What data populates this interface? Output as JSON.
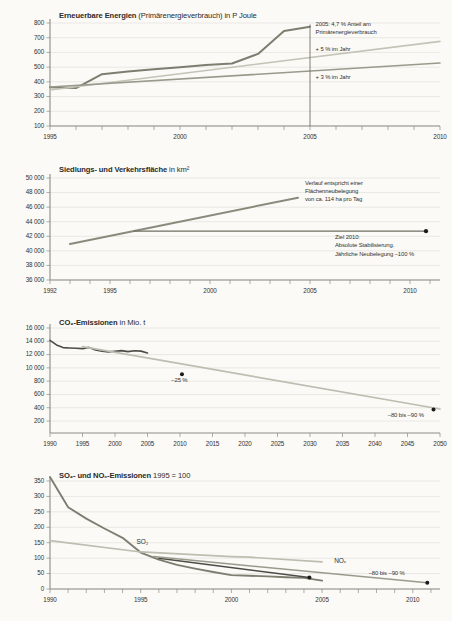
{
  "document": {
    "title": "Umweltindikatoren – Ziel- und Trendverläufe",
    "background_color": "#fbfaf7"
  },
  "palette": {
    "dark_line": "#6f6f63",
    "mid_line": "#9a9a8c",
    "light_line": "#bdbdb0",
    "very_light_line": "#cfcfc4",
    "dark_gray": "#4d4d46",
    "grid": "#d9d7d0",
    "axis": "#8d8b84",
    "text": "#33312e",
    "marker": "#1b1b1b"
  },
  "chart_data": [
    {
      "id": "renewable-energy",
      "type": "line",
      "title_bold": "Erneuerbare Energien",
      "title_rest": "(Primärenergieverbrauch) in P Joule",
      "xlabel": "",
      "ylabel": "",
      "xlim": [
        1995,
        2010
      ],
      "ylim": [
        100,
        800
      ],
      "ytick_labels": [
        "800",
        "700",
        "600",
        "500",
        "400",
        "300",
        "200",
        "100"
      ],
      "ytick_values": [
        800,
        700,
        600,
        500,
        400,
        300,
        200,
        100
      ],
      "xtick_values": [
        1995,
        1996,
        1997,
        1998,
        1999,
        2000,
        2001,
        2002,
        2003,
        2004,
        2005,
        2006,
        2007,
        2008,
        2009,
        2010
      ],
      "xtick_labels": [
        "1995",
        "2000",
        "2005",
        "2010"
      ],
      "xtick_label_values": [
        1995,
        2000,
        2005,
        2010
      ],
      "grid": true,
      "series": [
        {
          "name": "Ist-Verlauf erneuerbare Energien",
          "color": "#7d7d70",
          "width": 2.0,
          "x": [
            1995,
            1996,
            1997,
            1998,
            1999,
            2000,
            2001,
            2002,
            2003,
            2004,
            2005
          ],
          "values": [
            363,
            358,
            452,
            470,
            485,
            500,
            515,
            525,
            590,
            745,
            775
          ]
        },
        {
          "name": "+ 5 % im Jahr",
          "color": "#c3c3b6",
          "width": 1.6,
          "x": [
            1995,
            2010
          ],
          "values": [
            345,
            675
          ]
        },
        {
          "name": "+ 3 % im Jahr",
          "color": "#9a9a8c",
          "width": 1.6,
          "x": [
            1995,
            2010
          ],
          "values": [
            365,
            528
          ]
        }
      ],
      "vertical_marker": {
        "x": 2005,
        "y_from": 100,
        "y_to": 790
      },
      "annotations": [
        {
          "text_lines": [
            "2005: 4,7 % Anteil am",
            "Primärenergieverbrauch"
          ],
          "x": 2005.1,
          "y": 795
        },
        {
          "text_lines": [
            "+ 5 % im Jahr"
          ],
          "x": 2005.1,
          "y": 622
        },
        {
          "text_lines": [
            "+ 3 % im Jahr"
          ],
          "x": 2005.1,
          "y": 432
        }
      ]
    },
    {
      "id": "settlement-traffic-area",
      "type": "line",
      "title_bold": "Siedlungs- und Verkehrsfläche",
      "title_rest": "in km²",
      "xlim": [
        1992,
        2011.5
      ],
      "ylim": [
        36000,
        50000
      ],
      "ytick_labels": [
        "50 000",
        "48 000",
        "46 000",
        "44 000",
        "42 000",
        "40 000",
        "38 000",
        "36 000"
      ],
      "ytick_values": [
        50000,
        48000,
        46000,
        44000,
        42000,
        40000,
        38000,
        36000
      ],
      "xtick_values": [
        1992,
        1993,
        1994,
        1995,
        1996,
        1997,
        1998,
        1999,
        2000,
        2001,
        2002,
        2003,
        2004,
        2005,
        2006,
        2007,
        2008,
        2009,
        2010,
        2011
      ],
      "xtick_labels": [
        "1992",
        "1995",
        "2000",
        "2005",
        "2010"
      ],
      "xtick_label_values": [
        1992,
        1995,
        2000,
        2005,
        2010
      ],
      "grid": true,
      "series": [
        {
          "name": "Trend Flächenneubelegung",
          "color": "#8a8a7c",
          "width": 2.0,
          "x": [
            1993,
            2004.4
          ],
          "values": [
            40950,
            47300
          ]
        },
        {
          "name": "Ziel 2010 Stabilisierung",
          "color": "#6f6f63",
          "width": 1.2,
          "x": [
            1996.2,
            2010.8
          ],
          "values": [
            42700,
            42700
          ]
        }
      ],
      "markers": [
        {
          "x": 2010.8,
          "y": 42700,
          "color": "#1b1b1b",
          "r": 2.1
        }
      ],
      "annotations": [
        {
          "text_lines": [
            "Verlauf entspricht einer",
            "Flächenneubelegung",
            "von ca. 114 ha pro Tag"
          ],
          "x": 2004.6,
          "y": 49350
        },
        {
          "text_lines": [
            "Ziel 2010:",
            "Absolute Stabilisierung.",
            "Jährliche Neubelegung –100 %"
          ],
          "x": 2006.1,
          "y": 41900
        }
      ]
    },
    {
      "id": "co2-emissions",
      "type": "line",
      "title_bold": "CO₂-Emissionen",
      "title_rest": "in Mio. t",
      "xlim": [
        1990,
        2050
      ],
      "ylim": [
        200,
        16000
      ],
      "ytick_labels": [
        "16 000",
        "14 000",
        "12 000",
        "10 000",
        "800",
        "600",
        "400",
        "200"
      ],
      "ytick_values": [
        16000,
        14000,
        12000,
        10000,
        8000,
        6000,
        4000,
        2000
      ],
      "xtick_labels": [
        "1990",
        "1995",
        "2000",
        "2005",
        "2010",
        "2015",
        "2020",
        "2025",
        "2030",
        "2035",
        "2040",
        "2045",
        "2050"
      ],
      "xtick_label_values": [
        1990,
        1995,
        2000,
        2005,
        2010,
        2015,
        2020,
        2025,
        2030,
        2035,
        2040,
        2045,
        2050
      ],
      "grid": true,
      "series": [
        {
          "name": "CO₂-Emissionen Ist",
          "color": "#4d4d46",
          "width": 1.6,
          "x": [
            1990,
            1991,
            1992,
            1993,
            1994,
            1995,
            1996,
            1997,
            1998,
            1999,
            2000,
            2001,
            2002,
            2003,
            2004,
            2005
          ],
          "values": [
            14150,
            13450,
            13050,
            13000,
            12950,
            12900,
            13080,
            12700,
            12500,
            12400,
            12500,
            12600,
            12450,
            12580,
            12520,
            12250
          ]
        },
        {
          "name": "Zielpfad",
          "color": "#bdbdb0",
          "width": 1.6,
          "x": [
            1995,
            2050
          ],
          "values": [
            13200,
            3800
          ]
        }
      ],
      "markers": [
        {
          "x": 2010.3,
          "y": 9050,
          "color": "#1b1b1b",
          "r": 2.0
        },
        {
          "x": 2049,
          "y": 3750,
          "color": "#1b1b1b",
          "r": 2.0
        }
      ],
      "annotations": [
        {
          "text_lines": [
            "–25 %"
          ],
          "x": 2008.2,
          "y": 8150
        },
        {
          "text_lines": [
            "–80 bis –90 %"
          ],
          "x": 2041.5,
          "y": 2900
        }
      ]
    },
    {
      "id": "so2-nox-emissions",
      "type": "line",
      "title_bold": "SO₂- und NOₓ-Emissionen",
      "title_rest": "1995 = 100",
      "xlim": [
        1990,
        2011.5
      ],
      "ylim": [
        0,
        350
      ],
      "ytick_labels": [
        "350",
        "300",
        "250",
        "200",
        "150",
        "100",
        "50",
        "0"
      ],
      "ytick_values": [
        350,
        300,
        250,
        200,
        150,
        100,
        50,
        0
      ],
      "xtick_values": [
        1990,
        1991,
        1992,
        1993,
        1994,
        1995,
        1996,
        1997,
        1998,
        1999,
        2000,
        2001,
        2002,
        2003,
        2004,
        2005,
        2006,
        2007,
        2008,
        2009,
        2010,
        2011
      ],
      "xtick_labels": [
        "1990",
        "1995",
        "2000",
        "2005",
        "2010"
      ],
      "xtick_label_values": [
        1990,
        1995,
        2000,
        2005,
        2010
      ],
      "grid": true,
      "series": [
        {
          "name": "SO₂",
          "color": "#7d7d70",
          "width": 1.9,
          "x": [
            1990,
            1991,
            1992,
            1993,
            1994,
            1995,
            1996,
            1997,
            1998,
            1999,
            2000,
            2001,
            2002,
            2003,
            2004,
            2005
          ],
          "values": [
            363,
            265,
            228,
            196,
            166,
            118,
            95,
            78,
            66,
            55,
            45,
            43,
            41,
            38,
            36,
            27
          ]
        },
        {
          "name": "NOₓ",
          "color": "#bdbdb0",
          "width": 1.7,
          "x": [
            1990,
            1995,
            2000,
            2001,
            2005
          ],
          "values": [
            157,
            120,
            105,
            103,
            88
          ]
        },
        {
          "name": "Zielpfad SO₂",
          "color": "#4d4d46",
          "width": 1.5,
          "x": [
            1996,
            2004.3
          ],
          "values": [
            100,
            37
          ]
        },
        {
          "name": "Zielpfad NOₓ",
          "color": "#9a9a8c",
          "width": 1.5,
          "x": [
            1995.7,
            2010.8
          ],
          "values": [
            105,
            20
          ]
        }
      ],
      "markers": [
        {
          "x": 2004.3,
          "y": 37,
          "color": "#1b1b1b",
          "r": 2.0
        },
        {
          "x": 2010.8,
          "y": 20,
          "color": "#1b1b1b",
          "r": 2.0
        }
      ],
      "annotations": [
        {
          "text_lines": [
            "SO₂"
          ],
          "x": 1994.6,
          "y": 152,
          "size": 6.5
        },
        {
          "text_lines": [
            "NOₓ"
          ],
          "x": 2005.5,
          "y": 92,
          "size": 6.5
        },
        {
          "text_lines": [
            "–80 bis –90 %"
          ],
          "x": 2007.4,
          "y": 52
        }
      ]
    }
  ]
}
